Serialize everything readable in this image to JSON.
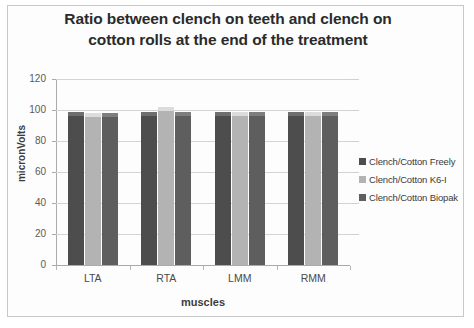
{
  "frame": {
    "border_color": "#c8c8c8"
  },
  "chart_data": {
    "type": "bar",
    "title": "Ratio between clench on teeth and clench on cotton rolls at the end of the treatment",
    "title_line1": "Ratio between clench on teeth and clench on",
    "title_line2": "cotton rolls at the end of the treatment",
    "xlabel": "muscles",
    "ylabel": "micronVolts",
    "categories": [
      "LTA",
      "RTA",
      "LMM",
      "RMM"
    ],
    "ylim": [
      0,
      120
    ],
    "yticks": [
      0,
      20,
      40,
      60,
      80,
      100,
      120
    ],
    "ytick_labels": [
      "0",
      "20",
      "40",
      "60",
      "80",
      "100",
      "120"
    ],
    "grid": true,
    "grid_color": "#d4d4d4",
    "legend_position": "right",
    "series": [
      {
        "name": "Clench/Cotton Freely",
        "color": "#4d4d4d",
        "cap_color": "#6e6e6e",
        "values": [
          99,
          99,
          99,
          99
        ]
      },
      {
        "name": "Clench/Cotton K6-I",
        "color": "#b3b3b3",
        "cap_color": "#dcdcdc",
        "values": [
          98,
          102,
          99,
          99
        ]
      },
      {
        "name": "Clench/Cotton Biopak",
        "color": "#5e5e5e",
        "cap_color": "#7e7e7e",
        "values": [
          98,
          99,
          99,
          99
        ]
      }
    ]
  }
}
